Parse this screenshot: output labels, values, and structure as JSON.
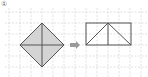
{
  "figure": {
    "label": "①",
    "grid": {
      "spacing": 11,
      "color": "#cccccc",
      "x_start": 9,
      "y_start": 12
    },
    "left_shape": {
      "type": "square-rotated-45",
      "fill": "#d4d4d4",
      "stroke": "#555555",
      "vertices": [
        [
          42,
          23
        ],
        [
          64,
          45
        ],
        [
          42,
          67
        ],
        [
          20,
          45
        ]
      ],
      "diagonals": true
    },
    "arrow": {
      "color": "#9a9a9a",
      "direction": "right"
    },
    "right_shape": {
      "type": "rectangle-with-triangle",
      "stroke": "#555555",
      "rect": {
        "x": 86,
        "y": 23,
        "width": 45,
        "height": 22
      },
      "apex": [
        108,
        23
      ]
    }
  }
}
